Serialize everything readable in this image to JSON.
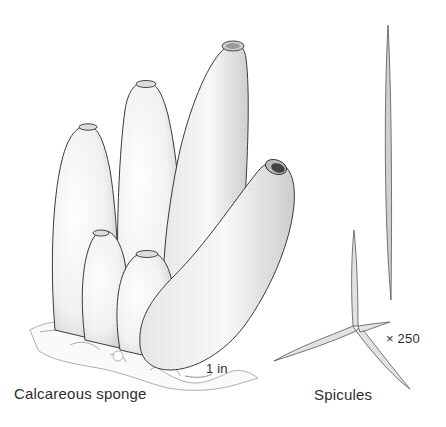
{
  "illustration": {
    "subject": "Calcareous sponge",
    "captions": {
      "sponge": "Calcareous sponge",
      "spicules": "Spicules"
    },
    "scale_labels": {
      "sponge_scale": "1 in",
      "spicule_magnification": "× 250"
    },
    "colors": {
      "background": "#ffffff",
      "ink": "#2e2e2e",
      "stipple": "#555555"
    }
  }
}
